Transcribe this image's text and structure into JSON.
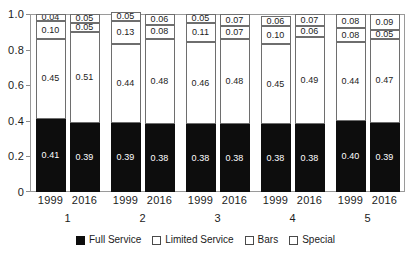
{
  "chart_data": {
    "type": "bar",
    "subtype": "stacked-bar-100-percent",
    "title": "",
    "subtitle": "",
    "xlabel": "",
    "ylabel": "",
    "ylim": [
      0,
      1.0
    ],
    "ytick_labels": [
      "0",
      "0.2",
      "0.4",
      "0.6",
      "0.8",
      "1.0"
    ],
    "ytick_values": [
      0,
      0.2,
      0.4,
      0.6,
      0.8,
      1.0
    ],
    "grid": false,
    "legend_position": "bottom",
    "stack_order_bottom_to_top": [
      "Full Service",
      "Limited Service",
      "Bars",
      "Special"
    ],
    "groups": [
      "1",
      "2",
      "3",
      "4",
      "5"
    ],
    "years": [
      "1999",
      "2016"
    ],
    "categories": [
      "1999 (1)",
      "2016 (1)",
      "1999 (2)",
      "2016 (2)",
      "1999 (3)",
      "2016 (3)",
      "1999 (4)",
      "2016 (4)",
      "1999 (5)",
      "2016 (5)"
    ],
    "series": [
      {
        "name": "Full Service",
        "color": "#0d0d0d",
        "values": [
          0.41,
          0.39,
          0.39,
          0.38,
          0.38,
          0.38,
          0.38,
          0.38,
          0.4,
          0.39
        ]
      },
      {
        "name": "Limited Service",
        "color": "#ffffff",
        "values": [
          0.45,
          0.51,
          0.44,
          0.48,
          0.46,
          0.48,
          0.45,
          0.49,
          0.44,
          0.47
        ]
      },
      {
        "name": "Bars",
        "color": "#ffffff",
        "values": [
          0.1,
          0.05,
          0.13,
          0.08,
          0.11,
          0.07,
          0.1,
          0.06,
          0.08,
          0.05
        ]
      },
      {
        "name": "Special",
        "color": "#ffffff",
        "values": [
          0.04,
          0.05,
          0.05,
          0.06,
          0.05,
          0.07,
          0.06,
          0.07,
          0.08,
          0.09
        ]
      }
    ],
    "bar_labels": [
      {
        "group": "1",
        "year": "1999",
        "full_service": "0.41",
        "limited_service": "0.45",
        "bars": "0.10",
        "special": "0.04"
      },
      {
        "group": "1",
        "year": "2016",
        "full_service": "0.39",
        "limited_service": "0.51",
        "bars": "0.05",
        "special": "0.05"
      },
      {
        "group": "2",
        "year": "1999",
        "full_service": "0.39",
        "limited_service": "0.44",
        "bars": "0.13",
        "special": "0.05"
      },
      {
        "group": "2",
        "year": "2016",
        "full_service": "0.38",
        "limited_service": "0.48",
        "bars": "0.08",
        "special": "0.06"
      },
      {
        "group": "3",
        "year": "1999",
        "full_service": "0.38",
        "limited_service": "0.46",
        "bars": "0.11",
        "special": "0.05"
      },
      {
        "group": "3",
        "year": "2016",
        "full_service": "0.38",
        "limited_service": "0.48",
        "bars": "0.07",
        "special": "0.07"
      },
      {
        "group": "4",
        "year": "1999",
        "full_service": "0.38",
        "limited_service": "0.45",
        "bars": "0.10",
        "special": "0.06"
      },
      {
        "group": "4",
        "year": "2016",
        "full_service": "0.38",
        "limited_service": "0.49",
        "bars": "0.06",
        "special": "0.07"
      },
      {
        "group": "5",
        "year": "1999",
        "full_service": "0.40",
        "limited_service": "0.44",
        "bars": "0.08",
        "special": "0.08"
      },
      {
        "group": "5",
        "year": "2016",
        "full_service": "0.39",
        "limited_service": "0.47",
        "bars": "0.05",
        "special": "0.09"
      }
    ]
  },
  "axis": {
    "y_ticks": [
      "1.0",
      "0.8",
      "0.6",
      "0.4",
      "0.2",
      "0"
    ],
    "x_years": [
      "1999",
      "2016",
      "1999",
      "2016",
      "1999",
      "2016",
      "1999",
      "2016",
      "1999",
      "2016"
    ],
    "x_groups": [
      "1",
      "2",
      "3",
      "4",
      "5"
    ]
  },
  "legend": {
    "items": [
      {
        "label": "Full Service",
        "swatch": "filled"
      },
      {
        "label": "Limited Service",
        "swatch": "hollow"
      },
      {
        "label": "Bars",
        "swatch": "hollow"
      },
      {
        "label": "Special",
        "swatch": "hollow"
      }
    ]
  }
}
